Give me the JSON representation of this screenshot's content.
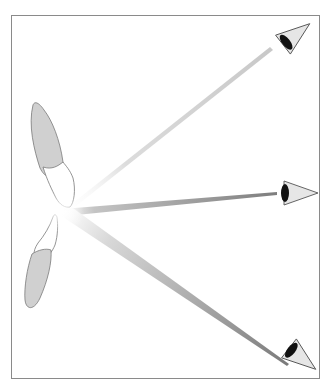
{
  "diagram": {
    "title": "",
    "colors": {
      "background": "#ffffff",
      "frame": "#8a8a8a",
      "tooth_root": "#d0d0d0",
      "tooth_outline": "#7a7a7a",
      "beam": "#8c8c8c",
      "eye_iris": "#111111",
      "eye_white": "#e6e6e6"
    },
    "frame": {
      "x": 11,
      "y": 15,
      "width": 309,
      "height": 364
    },
    "origin": {
      "x": 62,
      "y": 212
    },
    "teeth": [
      {
        "name": "upper-incisor"
      },
      {
        "name": "lower-incisor"
      }
    ],
    "beams": [
      {
        "name": "beam-top",
        "to_x": 272,
        "to_y": 48,
        "opacity": 0.35
      },
      {
        "name": "beam-middle",
        "to_x": 277,
        "to_y": 193,
        "opacity": 0.9
      },
      {
        "name": "beam-bottom",
        "to_x": 288,
        "to_y": 365,
        "opacity": 0.9
      }
    ],
    "eyes": [
      {
        "name": "eye-top",
        "x": 294,
        "y": 36,
        "rotation": -38
      },
      {
        "name": "eye-middle",
        "x": 298,
        "y": 193,
        "rotation": 0
      },
      {
        "name": "eye-bottom",
        "x": 300,
        "y": 357,
        "rotation": 38
      }
    ]
  }
}
